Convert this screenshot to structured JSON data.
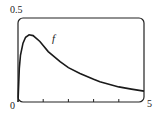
{
  "chart_data": {
    "type": "line",
    "title": "",
    "xlabel": "",
    "ylabel": "",
    "xlim": [
      0,
      5
    ],
    "ylim": [
      0,
      0.5
    ],
    "x_tick_labels": [
      "0",
      "5"
    ],
    "y_tick_labels": [
      "0.5"
    ],
    "x_minor_ticks": [
      1,
      2,
      3,
      4
    ],
    "grid": false,
    "legend": null,
    "annotations": [
      {
        "text": "f",
        "x": 1.4,
        "y": 0.39
      }
    ],
    "series": [
      {
        "name": "f",
        "x": [
          0,
          0.05,
          0.1,
          0.2,
          0.3,
          0.44,
          0.6,
          0.87,
          1.2,
          1.67,
          2.0,
          2.46,
          3.0,
          3.25,
          4.0,
          4.5,
          5.0
        ],
        "values": [
          0,
          0.2,
          0.28,
          0.35,
          0.385,
          0.4,
          0.395,
          0.36,
          0.3,
          0.24,
          0.205,
          0.17,
          0.135,
          0.12,
          0.09,
          0.077,
          0.065
        ]
      }
    ]
  },
  "labels": {
    "y_top": "0.5",
    "origin": "0",
    "x_right": "5",
    "curve": "f"
  }
}
